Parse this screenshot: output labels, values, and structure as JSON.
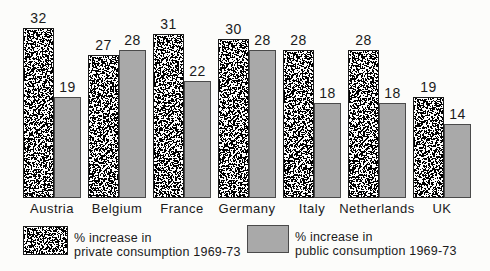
{
  "figure": {
    "background": "#fcfcfa",
    "colors": {
      "public_fill": "#a9a9a9",
      "bar_outline": "#1b1b1b",
      "text": "#1a1a1a",
      "speckle_black": "#000000",
      "speckle_white": "#ffffff"
    }
  },
  "chart_data": {
    "type": "bar",
    "title": "",
    "xlabel": "",
    "ylabel": "",
    "ylim": [
      0,
      36
    ],
    "axes_visible": false,
    "grid": false,
    "value_labels": true,
    "legend_position": "bottom",
    "categories": [
      "Austria",
      "Belgium",
      "France",
      "Germany",
      "Italy",
      "Netherlands",
      "UK"
    ],
    "series": [
      {
        "name": "% increase in private consumption 1969-73",
        "style": "speckle-texture",
        "values": [
          32,
          27,
          31,
          30,
          28,
          28,
          19
        ]
      },
      {
        "name": "% increase in public consumption 1969-73",
        "style": "solid-gray",
        "values": [
          19,
          28,
          22,
          28,
          18,
          18,
          14
        ]
      }
    ]
  },
  "legend": {
    "private": {
      "line1": "% increase in",
      "line2": "private consumption 1969-73",
      "swatch": "speckle-swatch"
    },
    "public": {
      "line1": "% increase in",
      "line2": "public consumption 1969-73",
      "swatch": "gray-swatch"
    }
  }
}
